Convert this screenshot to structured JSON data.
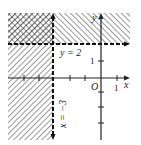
{
  "diagram": {
    "labels": {
      "y_eq": "y = 2",
      "x_eq": "x = −3",
      "origin": "O",
      "x_axis": "x",
      "y_axis": "y",
      "tick_x1": "1",
      "tick_y1": "1"
    },
    "lines": [
      {
        "equation": "y = 2",
        "style": "dashed"
      },
      {
        "equation": "x = -3",
        "style": "dashed"
      }
    ],
    "shaded_regions": [
      "x < -3",
      "y > 2"
    ],
    "colors": {
      "ink": "#222222",
      "background": "#ffffff"
    }
  }
}
